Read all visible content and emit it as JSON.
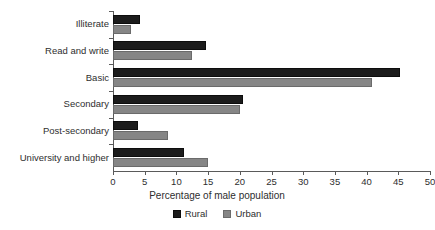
{
  "chart_data": {
    "type": "bar",
    "orientation": "horizontal",
    "title": "",
    "xlabel": "Percentage of male population",
    "ylabel": "",
    "xlim": [
      0,
      50
    ],
    "xticks": [
      0,
      5,
      10,
      15,
      20,
      25,
      30,
      35,
      40,
      45,
      50
    ],
    "grid": false,
    "legend_position": "bottom",
    "categories": [
      "Illiterate",
      "Read and write",
      "Basic",
      "Secondary",
      "Post-secondary",
      "University and higher"
    ],
    "series": [
      {
        "name": "Rural",
        "color": "#1c1c1c",
        "values": [
          4.2,
          14.7,
          45.3,
          20.5,
          4.0,
          11.2
        ]
      },
      {
        "name": "Urban",
        "color": "#868686",
        "values": [
          2.8,
          12.4,
          40.8,
          20.1,
          8.6,
          15.0
        ]
      }
    ]
  },
  "legend": {
    "items": [
      {
        "label": "Rural",
        "color": "#1c1c1c"
      },
      {
        "label": "Urban",
        "color": "#868686"
      }
    ]
  },
  "axis": {
    "x_title": "Percentage of male population",
    "x_tick_labels": [
      "0",
      "5",
      "10",
      "15",
      "20",
      "25",
      "30",
      "35",
      "40",
      "45",
      "50"
    ]
  }
}
